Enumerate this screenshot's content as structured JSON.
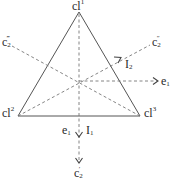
{
  "diagram": {
    "type": "symmetry-diagram",
    "colors": {
      "edge": "#555555",
      "dashed": "#777777",
      "text": "#2a2a2a"
    },
    "vertices": [
      {
        "id": "cl1",
        "label": "cl",
        "sup": "1"
      },
      {
        "id": "cl2",
        "label": "cl",
        "sup": "2"
      },
      {
        "id": "cl3",
        "label": "cl",
        "sup": "3"
      }
    ],
    "axis_labels": {
      "c2_prime": {
        "base": "c",
        "sub": "2",
        "sup": "′"
      },
      "c2_double": {
        "base": "c",
        "sub": "2",
        "sup": "″"
      },
      "c2_triple": {
        "base": "c",
        "sub": "2",
        "sup": "‴"
      },
      "e1_right": {
        "base": "e",
        "sub": "1"
      },
      "e1_bottom": {
        "base": "e",
        "sub": "1"
      },
      "I1": {
        "base": "I",
        "sub": "1"
      },
      "I2": {
        "base": "I",
        "sub": "2"
      }
    }
  }
}
